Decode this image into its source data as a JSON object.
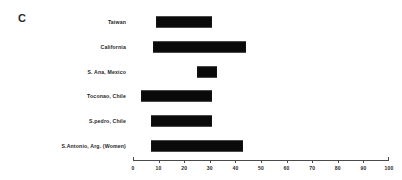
{
  "panel": {
    "letter": "C"
  },
  "chart_data": {
    "type": "bar",
    "orientation": "horizontal",
    "bar_style": "floating-range",
    "title": "C",
    "xlabel": "",
    "ylabel": "",
    "xlim": [
      0,
      100
    ],
    "xticks": [
      0,
      10,
      20,
      30,
      40,
      50,
      60,
      70,
      80,
      90,
      100
    ],
    "xtick_labels": [
      "0",
      "10",
      "20",
      "30",
      "40",
      "50",
      "60",
      "70",
      "80",
      "90",
      "100"
    ],
    "grid": false,
    "legend": false,
    "bar_color": "#0a0a0a",
    "axis_color": "#4a4a4a",
    "categories": [
      "Taiwan",
      "California",
      "S. Ana, Mexico",
      "Toconao, Chile",
      "S.pedro, Chile",
      "S.Antonio, Arg. (Women)"
    ],
    "ranges": [
      {
        "category": "Taiwan",
        "start": 9,
        "end": 31
      },
      {
        "category": "California",
        "start": 8,
        "end": 44
      },
      {
        "category": "S. Ana, Mexico",
        "start": 25,
        "end": 33
      },
      {
        "category": "Toconao, Chile",
        "start": 3,
        "end": 31
      },
      {
        "category": "S.pedro, Chile",
        "start": 7,
        "end": 31
      },
      {
        "category": "S.Antonio, Arg. (Women)",
        "start": 7,
        "end": 43
      }
    ],
    "values": [
      22,
      36,
      8,
      28,
      24,
      36
    ]
  }
}
